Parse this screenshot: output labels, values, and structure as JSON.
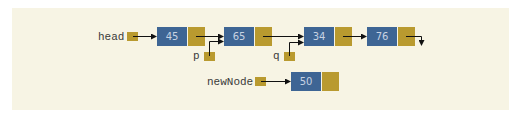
{
  "diagram": {
    "type": "linked-list-insertion",
    "colors": {
      "background": "#f7f4e4",
      "data_box": "#3e6594",
      "pointer_box": "#b99a2f",
      "data_text": "#c7d2e2",
      "label_text": "#3a3a3a"
    },
    "pointers": {
      "head": "head",
      "p": "p",
      "q": "q",
      "newNode": "newNode"
    },
    "list_nodes": [
      {
        "value": "45"
      },
      {
        "value": "65"
      },
      {
        "value": "34"
      },
      {
        "value": "76"
      }
    ],
    "new_node": {
      "value": "50"
    },
    "annotations": {
      "head_points_to": "45",
      "p_points_to": "65",
      "q_points_to": "34",
      "last_node_next": "null",
      "newNode_points_to": "50"
    }
  }
}
